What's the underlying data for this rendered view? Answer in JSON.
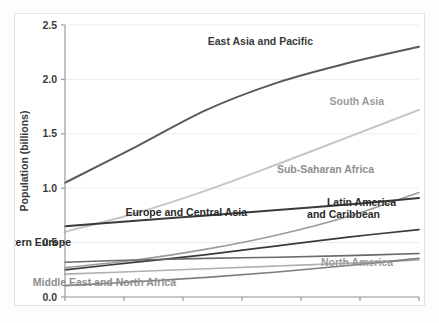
{
  "chart_data": {
    "type": "line",
    "title": "",
    "subtitle": "",
    "xlabel": "",
    "ylabel": "Population (billions)",
    "x": [
      "1960s",
      "1970s",
      "1980s",
      "1990s",
      "2000s",
      "2010s"
    ],
    "xtick_labels": [
      "1960s",
      "1970s",
      "1980s",
      "1990s",
      "2000s",
      "2010s"
    ],
    "ytick_labels": [
      "0.0",
      "0.5",
      "1.0",
      "1.5",
      "2.0",
      "2.5"
    ],
    "ytick_values": [
      0.0,
      0.5,
      1.0,
      1.5,
      2.0,
      2.5
    ],
    "ylim": [
      0.0,
      2.5
    ],
    "grid": "horizontal",
    "legend_position": "inline-labels",
    "series": [
      {
        "name": "East Asia and Pacific",
        "color": "#5a5a5a",
        "width": 2.0,
        "label_x": 0.68,
        "label_y": 2.32,
        "label_anchor": "middle",
        "values": [
          1.05,
          1.38,
          1.72,
          1.97,
          2.15,
          2.3
        ]
      },
      {
        "name": "South Asia",
        "color": "#c6c6c6",
        "width": 2.0,
        "label_x": 0.8,
        "label_y": 1.68,
        "label_anchor": "middle",
        "values": [
          0.6,
          0.77,
          0.98,
          1.22,
          1.47,
          1.72
        ]
      },
      {
        "name": "Sub-Saharan Africa",
        "color": "#9b9b9b",
        "width": 1.6,
        "label_x": 0.8,
        "label_y": 1.1,
        "label_anchor": "middle",
        "values": [
          0.27,
          0.34,
          0.44,
          0.57,
          0.74,
          0.96
        ]
      },
      {
        "name": "Europe and Central Asia",
        "color": "#3a3a3a",
        "width": 2.0,
        "label_x": 0.44,
        "label_y": 0.63,
        "label_anchor": "middle",
        "values": [
          0.65,
          0.7,
          0.75,
          0.8,
          0.85,
          0.91
        ]
      },
      {
        "name": "Latin America and Caribbean",
        "color": "#3a3a3a",
        "width": 1.7,
        "label_x": 0.88,
        "label_y": 0.72,
        "label_anchor": "middle",
        "values": [
          0.25,
          0.32,
          0.39,
          0.47,
          0.55,
          0.62
        ]
      },
      {
        "name": "Western Europe",
        "color": "#6a6a6a",
        "width": 1.6,
        "label_x": 0.09,
        "label_y": 0.43,
        "label_anchor": "start",
        "values": [
          0.32,
          0.34,
          0.355,
          0.365,
          0.38,
          0.4
        ]
      },
      {
        "name": "North America",
        "color": "#b0b0b0",
        "width": 1.6,
        "label_x": 0.9,
        "label_y": 0.21,
        "label_anchor": "middle",
        "values": [
          0.21,
          0.235,
          0.26,
          0.285,
          0.31,
          0.34
        ]
      },
      {
        "name": "Middle East and North Africa",
        "color": "#7d7d7d",
        "width": 1.6,
        "label_x": 0.43,
        "label_y": 0.09,
        "label_anchor": "middle",
        "values": [
          0.105,
          0.14,
          0.18,
          0.23,
          0.29,
          0.355
        ]
      }
    ],
    "inline_labels": [
      {
        "text": "East Asia and Pacific",
        "color": "#3a3a3a",
        "x": 312,
        "y": 42
      },
      {
        "text": "South Asia",
        "color": "#9b9b9b",
        "x": 383,
        "y": 102
      },
      {
        "text": "Sub-Saharan Africa",
        "color": "#8e8e8e",
        "x": 373,
        "y": 170
      },
      {
        "text": "Europe and Central Asia",
        "color": "#2b2b2b",
        "x": 246,
        "y": 213
      },
      {
        "text": "Latin America",
        "color": "#2b2b2b",
        "x": 395,
        "y": 203
      },
      {
        "text": "and Caribbean",
        "color": "#2b2b2b",
        "x": 379,
        "y": 215
      },
      {
        "text": "Western Europe",
        "color": "#2b2b2b",
        "x": 70,
        "y": 243
      },
      {
        "text": "North America",
        "color": "#9b9b9b",
        "x": 392,
        "y": 263
      },
      {
        "text": "Middle East and North Africa",
        "color": "#8e8e8e",
        "x": 175,
        "y": 283
      }
    ]
  }
}
